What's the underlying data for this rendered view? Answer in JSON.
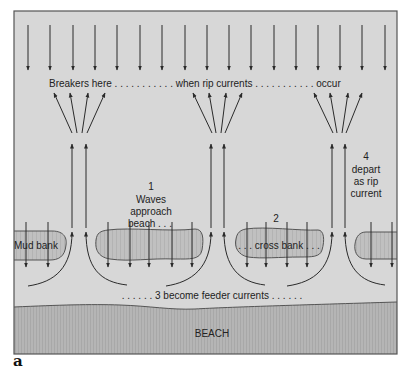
{
  "figure": {
    "label": "a",
    "colors": {
      "water": "#d7d7d7",
      "frame": "#555555",
      "bank_fill": "#bdbdbd",
      "beach_fill": "#b3b3b3",
      "arrow": "#2a2a2a"
    }
  },
  "labels": {
    "breakers": "Breakers here . . . . . . . . . . . when rip currents . . . . . . . . . . . occur",
    "step1_num": "1",
    "step1_line1": "Waves",
    "step1_line2": "approach",
    "step1_line3": "beach . . .",
    "step2_num": "2",
    "step2_text": ". . . cross bank . . .",
    "step3_text": ". . . . . . 3  become feeder currents . . . . . .",
    "step4_num": "4",
    "step4_line1": "depart",
    "step4_line2": "as rip",
    "step4_line3": "current",
    "mud_bank": "Mud bank",
    "beach": "BEACH"
  }
}
